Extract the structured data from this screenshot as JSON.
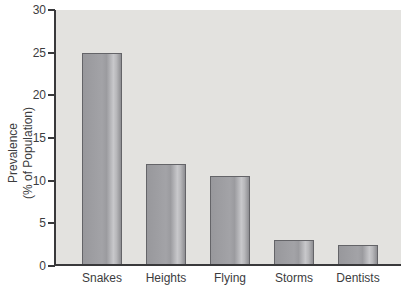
{
  "chart_data": {
    "type": "bar",
    "title": "",
    "categories": [
      "Snakes",
      "Heights",
      "Flying",
      "Storms",
      "Dentists"
    ],
    "values": [
      25,
      12,
      10.5,
      3,
      2.5
    ],
    "xlabel": "",
    "ylabel": "Prevalence (% of Population)",
    "ylabel_line1": "Prevalence",
    "ylabel_line2": "(% of Population)",
    "ylim": [
      0,
      30
    ],
    "yticks": [
      0,
      5,
      10,
      15,
      20,
      25,
      30
    ],
    "grid": false,
    "legend": "none",
    "colors": {
      "page_background": "#ffffff",
      "plot_background": "#e3e2df",
      "bar_fill": "#9f9fa3",
      "bar_highlight": "#c8c8cb",
      "bar_border": "#646468",
      "axis": "#39393b",
      "text": "#3c3c3e"
    }
  }
}
